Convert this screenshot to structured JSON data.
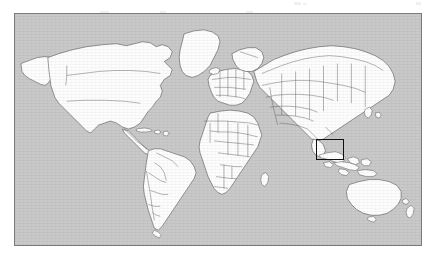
{
  "figure": {
    "kind": "world-map",
    "projection": "equirectangular",
    "caption": "",
    "page_background": "#ffffff",
    "ocean_color": "#c9c9c9",
    "land_color": "#fdfdfd",
    "border_color": "#4a4a4a",
    "frame_color": "#7b7b7b",
    "highlight_color": "#101010"
  },
  "frame": {
    "label": "map-frame",
    "x": 14,
    "y": 13,
    "width": 408,
    "height": 233
  },
  "highlight": {
    "label": "study-area-highlight",
    "region_name": "Southeast Asia / Indonesian Archipelago",
    "x": 316,
    "y": 139,
    "width": 28,
    "height": 21,
    "stroke_width": 1.8
  },
  "legend": {
    "entries": []
  },
  "labels": {
    "title": "",
    "subtitle": "",
    "axis_x": "",
    "axis_y": "",
    "tick_labels": []
  },
  "graticule": {
    "visible": false,
    "lon_range": [
      -180,
      180
    ],
    "lat_range": [
      -90,
      90
    ]
  },
  "continents": [
    "North America",
    "South America",
    "Europe",
    "Africa",
    "Asia",
    "Australia",
    "Greenland"
  ]
}
